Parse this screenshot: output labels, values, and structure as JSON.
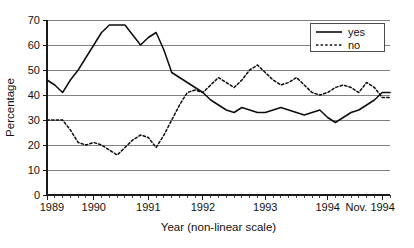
{
  "chart_data": {
    "type": "line",
    "title": "",
    "xlabel": "Year (non-linear scale)",
    "ylabel": "Percentage",
    "ylim": [
      0,
      70
    ],
    "ytick_values": [
      0,
      10,
      20,
      30,
      40,
      50,
      60,
      70
    ],
    "ytick_labels": [
      "0",
      "10",
      "20",
      "30",
      "40",
      "50",
      "60",
      "70"
    ],
    "xtick_labels": [
      "1989",
      "1990",
      "1991",
      "1992",
      "1993",
      "1994",
      "Nov. 1994"
    ],
    "xtick_positions": [
      0,
      6,
      13,
      20,
      28,
      36,
      43
    ],
    "grid": "horizontal",
    "legend_position": "top-right",
    "x_index_max": 44,
    "series": [
      {
        "name": "yes",
        "style": "solid",
        "color": "#0d0d0d",
        "x": [
          0,
          1,
          2,
          3,
          4,
          5,
          6,
          7,
          8,
          9,
          10,
          11,
          12,
          13,
          14,
          15,
          16,
          17,
          18,
          19,
          20,
          21,
          22,
          23,
          24,
          25,
          26,
          27,
          28,
          29,
          30,
          31,
          32,
          33,
          34,
          35,
          36,
          37,
          38,
          39,
          40,
          41,
          42,
          43,
          44
        ],
        "values": [
          46,
          44,
          41,
          46,
          50,
          55,
          60,
          65,
          68,
          68,
          68,
          64,
          60,
          63,
          65,
          58,
          49,
          47,
          45,
          43,
          41,
          38,
          36,
          34,
          33,
          35,
          34,
          33,
          33,
          34,
          35,
          34,
          33,
          32,
          33,
          34,
          31,
          29,
          31,
          33,
          34,
          36,
          38,
          41,
          41
        ]
      },
      {
        "name": "no",
        "style": "dotted",
        "color": "#0d0d0d",
        "x": [
          0,
          1,
          2,
          3,
          4,
          5,
          6,
          7,
          8,
          9,
          10,
          11,
          12,
          13,
          14,
          15,
          16,
          17,
          18,
          19,
          20,
          21,
          22,
          23,
          24,
          25,
          26,
          27,
          28,
          29,
          30,
          31,
          32,
          33,
          34,
          35,
          36,
          37,
          38,
          39,
          40,
          41,
          42,
          43,
          44
        ],
        "values": [
          30,
          30,
          30,
          26,
          21,
          20,
          21,
          20,
          18,
          16,
          19,
          22,
          24,
          23,
          19,
          24,
          30,
          36,
          41,
          42,
          41,
          44,
          47,
          45,
          43,
          46,
          50,
          52,
          49,
          46,
          44,
          45,
          47,
          44,
          41,
          40,
          41,
          43,
          44,
          43,
          41,
          45,
          43,
          39,
          39
        ]
      }
    ]
  },
  "legend": {
    "items": [
      {
        "label": "yes",
        "style": "solid"
      },
      {
        "label": "no",
        "style": "dotted"
      }
    ]
  }
}
